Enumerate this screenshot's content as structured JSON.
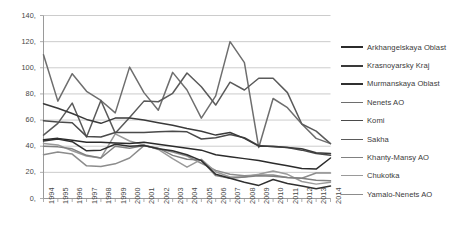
{
  "chart_data": {
    "type": "line",
    "title": "",
    "xlabel": "",
    "ylabel": "",
    "categories": [
      "1994",
      "1995",
      "1996",
      "1997",
      "1998",
      "1999",
      "2000",
      "2001",
      "2002",
      "2003",
      "2004",
      "2005",
      "2006",
      "2007",
      "2008",
      "2009",
      "2010",
      "2011",
      "2012",
      "2013",
      "2014"
    ],
    "x_tick_labels": [
      "1994",
      "1995",
      "1996",
      "1997",
      "1998",
      "1999",
      "2000",
      "2001",
      "2002",
      "2003",
      "2004",
      "2005",
      "2006",
      "2007",
      "2008",
      "2009",
      "2010",
      "2011",
      "2012",
      "2013",
      "2014"
    ],
    "y_tick_labels": [
      "140,",
      "120,",
      "100,",
      "80,",
      "60,",
      "40,",
      "20,",
      "0,"
    ],
    "y_tick_values": [
      140,
      120,
      100,
      80,
      60,
      40,
      20,
      0
    ],
    "ylim": [
      0,
      140
    ],
    "grid": "horizontal",
    "legend_position": "right",
    "series": [
      {
        "name": "Arkhangelskaya Oblast",
        "color": "#2b2b2b",
        "values": [
          45.0,
          46.0,
          44.5,
          43.0,
          43.0,
          42.5,
          42.0,
          43.0,
          41.5,
          40.0,
          38.5,
          37.0,
          33.5,
          32.0,
          30.5,
          29.0,
          27.0,
          25.0,
          23.0,
          22.5,
          31.0
        ]
      },
      {
        "name": "Krasnoyarsky Kraj",
        "color": "#3a3a3a",
        "values": [
          72.5,
          69.0,
          65.0,
          60.5,
          57.5,
          61.5,
          61.5,
          60.0,
          58.0,
          56.0,
          53.5,
          51.5,
          48.5,
          50.5,
          46.0,
          40.0,
          40.0,
          39.0,
          38.0,
          35.0,
          34.5
        ]
      },
      {
        "name": "Murmanskaya Oblast",
        "color": "#303030",
        "values": [
          44.0,
          45.5,
          43.5,
          36.5,
          37.0,
          41.5,
          40.0,
          40.5,
          38.0,
          36.5,
          33.5,
          29.0,
          18.5,
          15.5,
          12.5,
          10.0,
          14.5,
          11.5,
          9.5,
          7.5,
          9.5
        ]
      },
      {
        "name": "Nenets AO",
        "color": "#6e6e6e",
        "values": [
          110.0,
          74.5,
          95.5,
          82.0,
          75.0,
          65.5,
          100.5,
          81.0,
          67.5,
          96.5,
          83.0,
          61.5,
          78.5,
          120.0,
          104.0,
          39.0,
          76.5,
          69.5,
          57.0,
          46.0,
          42.0
        ]
      },
      {
        "name": "Komi",
        "color": "#4a4a4a",
        "values": [
          59.5,
          58.5,
          58.0,
          47.5,
          47.0,
          50.5,
          50.5,
          50.5,
          51.0,
          51.5,
          51.0,
          45.5,
          46.5,
          49.0,
          46.5,
          40.5,
          39.5,
          39.0,
          37.0,
          34.5,
          33.0
        ]
      },
      {
        "name": "Sakha",
        "color": "#5a5a5a",
        "values": [
          48.5,
          57.5,
          73.0,
          47.0,
          75.0,
          50.0,
          62.0,
          74.5,
          74.0,
          80.5,
          96.0,
          85.5,
          71.5,
          89.0,
          83.0,
          92.0,
          92.0,
          81.0,
          57.0,
          51.5,
          42.0
        ]
      },
      {
        "name": "Khanty-Mansy AO",
        "color": "#808080",
        "values": [
          40.0,
          39.5,
          38.0,
          33.0,
          31.0,
          40.0,
          38.5,
          40.5,
          38.5,
          33.0,
          30.0,
          29.5,
          17.5,
          15.5,
          16.5,
          17.5,
          17.0,
          16.0,
          15.5,
          14.0,
          13.5
        ]
      },
      {
        "name": "Chukotka",
        "color": "#9a9a9a",
        "values": [
          42.0,
          41.0,
          36.5,
          32.5,
          31.0,
          49.5,
          44.0,
          41.0,
          37.5,
          30.5,
          24.0,
          30.0,
          20.5,
          16.5,
          16.5,
          18.5,
          21.0,
          18.5,
          13.0,
          11.0,
          12.5
        ]
      },
      {
        "name": "Yamalo-Nenets AO",
        "color": "#8c8c8c",
        "values": [
          33.5,
          35.5,
          34.0,
          25.0,
          24.5,
          26.5,
          31.0,
          40.5,
          38.0,
          35.5,
          32.5,
          27.0,
          21.5,
          18.5,
          17.5,
          18.0,
          18.0,
          16.0,
          15.5,
          19.5,
          19.5
        ]
      }
    ]
  },
  "legend": {
    "items": [
      {
        "label": "Arkhangelskaya Oblast"
      },
      {
        "label": "Krasnoyarsky Kraj"
      },
      {
        "label": "Murmanskaya Oblast"
      },
      {
        "label": "Nenets AO"
      },
      {
        "label": "Komi"
      },
      {
        "label": "Sakha"
      },
      {
        "label": "Khanty-Mansy AO"
      },
      {
        "label": "Chukotka"
      },
      {
        "label": "Yamalo-Nenets AO"
      }
    ]
  }
}
